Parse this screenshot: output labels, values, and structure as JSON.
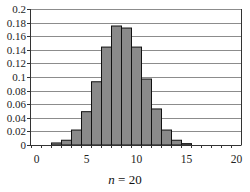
{
  "chart_data": {
    "type": "bar",
    "title": "",
    "caption": {
      "variable": "n",
      "equals": "=",
      "value": "20"
    },
    "xlabel": "",
    "ylabel": "",
    "x": [
      0,
      1,
      2,
      3,
      4,
      5,
      6,
      7,
      8,
      9,
      10,
      11,
      12,
      13,
      14,
      15,
      16,
      17,
      18,
      19,
      20
    ],
    "values": [
      0,
      0,
      0.003,
      0.007,
      0.022,
      0.049,
      0.093,
      0.144,
      0.175,
      0.172,
      0.144,
      0.097,
      0.053,
      0.022,
      0.007,
      0.002,
      0,
      0,
      0,
      0,
      0
    ],
    "xlim": [
      0,
      20
    ],
    "ylim": [
      0,
      0.2
    ],
    "xticks": [
      "0",
      "5",
      "10",
      "15",
      "20"
    ],
    "xtick_values": [
      0,
      5,
      10,
      15,
      20
    ],
    "yticks": [
      "0",
      "0.02",
      "0.04",
      "0.06",
      "0.08",
      "0.1",
      "0.12",
      "0.14",
      "0.16",
      "0.18",
      "0.2"
    ],
    "ytick_values": [
      0,
      0.02,
      0.04,
      0.06,
      0.08,
      0.1,
      0.12,
      0.14,
      0.16,
      0.18,
      0.2
    ],
    "grid": {
      "horizontal": true,
      "vertical": false
    },
    "legend": null,
    "colors": {
      "bar_fill": "#8a8a8a",
      "bar_stroke": "#111111",
      "grid": "#8c8c8c",
      "frame": "#333333"
    }
  }
}
